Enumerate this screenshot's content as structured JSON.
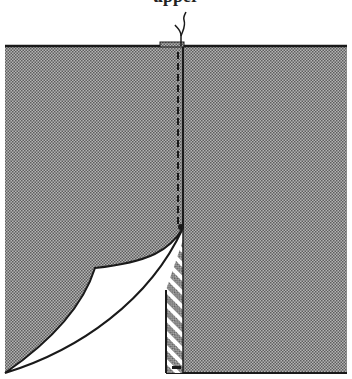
{
  "caption": {
    "partial_text": "upper",
    "note": "text line cropped at top edge"
  },
  "diagram": {
    "colors": {
      "fabric_fill": "#9a9a9a",
      "fabric_dot": "#6a6a6a",
      "outline": "#1a1a1a",
      "background": "#ffffff",
      "hatch": "#444444"
    },
    "parts": [
      {
        "id": "left-panel",
        "label": "left fabric panel"
      },
      {
        "id": "right-panel",
        "label": "right fabric panel"
      },
      {
        "id": "stitch-line",
        "label": "dashed stitching line"
      },
      {
        "id": "thread-ends",
        "label": "thread tails"
      },
      {
        "id": "folded-corner",
        "label": "folded-back corner (wrong side)"
      },
      {
        "id": "hatched-facing",
        "label": "hatched facing strip"
      },
      {
        "id": "bottom-tab",
        "label": "bottom stop"
      }
    ]
  }
}
